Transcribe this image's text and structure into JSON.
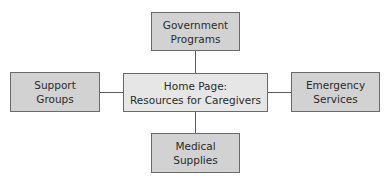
{
  "diagram": {
    "type": "hub-and-spoke",
    "center": {
      "id": "home",
      "lines": [
        "Home Page:",
        "Resources for Caregivers"
      ],
      "fill": "#e6e6e6"
    },
    "nodes": [
      {
        "id": "government",
        "position": "top",
        "lines": [
          "Government",
          "Programs"
        ],
        "fill": "#d2d2d2"
      },
      {
        "id": "support",
        "position": "left",
        "lines": [
          "Support",
          "Groups"
        ],
        "fill": "#d2d2d2"
      },
      {
        "id": "emergency",
        "position": "right",
        "lines": [
          "Emergency",
          "Services"
        ],
        "fill": "#d2d2d2"
      },
      {
        "id": "medical",
        "position": "bottom",
        "lines": [
          "Medical",
          "Supplies"
        ],
        "fill": "#d2d2d2"
      }
    ],
    "edges": [
      {
        "from": "home",
        "to": "government"
      },
      {
        "from": "home",
        "to": "support"
      },
      {
        "from": "home",
        "to": "emergency"
      },
      {
        "from": "home",
        "to": "medical"
      }
    ]
  }
}
